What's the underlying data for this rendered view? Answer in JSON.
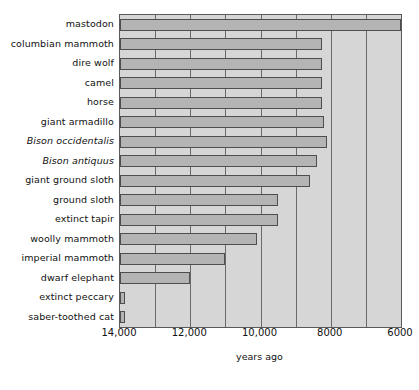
{
  "chart_data": {
    "type": "bar",
    "orientation": "horizontal",
    "title": "",
    "xlabel": "years ago",
    "ylabel": "",
    "xlim": [
      14000,
      6000
    ],
    "x_axis_reversed": true,
    "grid": true,
    "legend": false,
    "bar_start": 14000,
    "xticks": [
      14000,
      12000,
      10000,
      8000,
      6000
    ],
    "xtick_labels": [
      "14,000",
      "12,000",
      "10,000",
      "8000",
      "6000"
    ],
    "gridline_values": [
      13000,
      12000,
      11000,
      10000,
      9000,
      8000,
      7000,
      6000
    ],
    "categories": [
      "mastodon",
      "columbian mammoth",
      "dire wolf",
      "camel",
      "horse",
      "giant armadillo",
      "Bison occidentalis",
      "Bison antiquus",
      "giant ground sloth",
      "ground sloth",
      "extinct tapir",
      "woolly mammoth",
      "imperial mammoth",
      "dwarf elephant",
      "extinct peccary",
      "saber-toothed cat"
    ],
    "category_styles": [
      "normal",
      "normal",
      "normal",
      "normal",
      "normal",
      "normal",
      "italic",
      "italic",
      "normal",
      "normal",
      "normal",
      "normal",
      "normal",
      "normal",
      "normal",
      "normal"
    ],
    "values": [
      6000,
      8250,
      8250,
      8250,
      8250,
      8200,
      8100,
      8400,
      8600,
      9500,
      9500,
      10100,
      11000,
      12000,
      13850,
      13850
    ],
    "colors": {
      "bar_fill": "#b4b4b4",
      "bar_edge": "#4e4e4e",
      "plot_background": "#d6d6d6",
      "gridline": "#6a6a6a",
      "text": "#111111",
      "page_background": "#ffffff"
    }
  }
}
